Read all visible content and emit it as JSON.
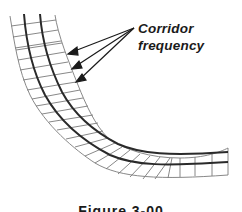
{
  "figure": {
    "annotation": {
      "line1": "Corridor",
      "line2": "frequency",
      "arrow_count": 3
    },
    "caption": "Figure 3-00",
    "colors": {
      "centerline": "#2a2a2a",
      "gridline": "#7a7a7a",
      "text": "#1a1a1a"
    }
  }
}
